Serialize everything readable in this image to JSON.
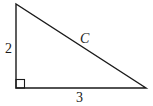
{
  "diagram": {
    "type": "right-triangle",
    "vertices": {
      "top": [
        16,
        4
      ],
      "right_angle": [
        16,
        88
      ],
      "right": [
        146,
        88
      ]
    },
    "labels": {
      "vertical_leg": "2",
      "horizontal_leg": "3",
      "hypotenuse": "C"
    },
    "right_angle_marker": true,
    "colors": {
      "stroke": "#1a1a1a",
      "background": "#ffffff"
    }
  }
}
